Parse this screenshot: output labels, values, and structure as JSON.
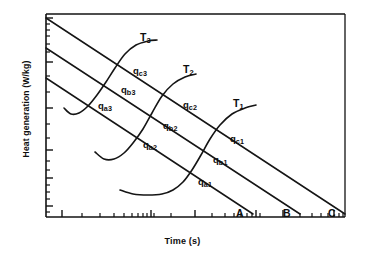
{
  "chart_data": {
    "type": "line",
    "title": "",
    "xlabel": "Time (s)",
    "ylabel": "Heat generation (W/kg)",
    "x_scale": "log",
    "y_scale": "log",
    "grid": false,
    "legend": "none",
    "axis_ticks_labeled": false,
    "series": [
      {
        "name": "A",
        "kind": "dissipation-line",
        "label": "A",
        "label_xy": [
          236,
          208
        ],
        "points": [
          [
            46,
            78
          ],
          [
            253,
            214
          ]
        ]
      },
      {
        "name": "B",
        "kind": "dissipation-line",
        "label": "B",
        "label_xy": [
          283,
          208
        ],
        "points": [
          [
            46,
            48
          ],
          [
            300,
            214
          ]
        ]
      },
      {
        "name": "C",
        "kind": "dissipation-line",
        "label": "C",
        "label_xy": [
          328,
          208
        ],
        "points": [
          [
            46,
            18
          ],
          [
            345,
            214
          ]
        ]
      },
      {
        "name": "T3",
        "kind": "generation-curve",
        "label": "T3",
        "label_xy": [
          140,
          32
        ],
        "points": [
          [
            64,
            108
          ],
          [
            71,
            114
          ],
          [
            79,
            113
          ],
          [
            88,
            106
          ],
          [
            97,
            95
          ],
          [
            106,
            82
          ],
          [
            115,
            68
          ],
          [
            125,
            54
          ],
          [
            136,
            45
          ],
          [
            148,
            41
          ],
          [
            157,
            40
          ]
        ]
      },
      {
        "name": "T2",
        "kind": "generation-curve",
        "label": "T2",
        "label_xy": [
          183,
          64
        ],
        "points": [
          [
            95,
            152
          ],
          [
            104,
            159
          ],
          [
            114,
            159
          ],
          [
            124,
            153
          ],
          [
            133,
            143
          ],
          [
            143,
            129
          ],
          [
            152,
            113
          ],
          [
            162,
            96
          ],
          [
            173,
            84
          ],
          [
            185,
            77
          ],
          [
            196,
            74
          ]
        ]
      },
      {
        "name": "T1",
        "kind": "generation-curve",
        "label": "T1",
        "label_xy": [
          233,
          98
        ],
        "points": [
          [
            120,
            190
          ],
          [
            133,
            194
          ],
          [
            148,
            195
          ],
          [
            162,
            194
          ],
          [
            173,
            190
          ],
          [
            183,
            182
          ],
          [
            192,
            170
          ],
          [
            201,
            155
          ],
          [
            210,
            139
          ],
          [
            220,
            125
          ],
          [
            232,
            114
          ],
          [
            245,
            108
          ],
          [
            256,
            105
          ]
        ]
      }
    ],
    "intersection_labels": [
      {
        "id": "qa3",
        "base": "q",
        "sub": "a3",
        "x": 98,
        "y": 101,
        "line": "A",
        "curve": "T3"
      },
      {
        "id": "qb3",
        "base": "q",
        "sub": "b3",
        "x": 121,
        "y": 85,
        "line": "B",
        "curve": "T3"
      },
      {
        "id": "qc3",
        "base": "q",
        "sub": "c3",
        "x": 133,
        "y": 66,
        "line": "C",
        "curve": "T3"
      },
      {
        "id": "qa2",
        "base": "q",
        "sub": "a2",
        "x": 143,
        "y": 140,
        "line": "A",
        "curve": "T2"
      },
      {
        "id": "qb2",
        "base": "q",
        "sub": "b2",
        "x": 163,
        "y": 121,
        "line": "B",
        "curve": "T2"
      },
      {
        "id": "qc2",
        "base": "q",
        "sub": "c2",
        "x": 183,
        "y": 100,
        "line": "C",
        "curve": "T2"
      },
      {
        "id": "qa1",
        "base": "q",
        "sub": "a1",
        "x": 198,
        "y": 177,
        "line": "A",
        "curve": "T1"
      },
      {
        "id": "qb1",
        "base": "q",
        "sub": "b1",
        "x": 213,
        "y": 155,
        "line": "B",
        "curve": "T1"
      },
      {
        "id": "qc1",
        "base": "q",
        "sub": "c1",
        "x": 230,
        "y": 134,
        "line": "C",
        "curve": "T1"
      }
    ],
    "axes": {
      "plot_left": 46,
      "plot_right": 345,
      "plot_top": 14,
      "plot_bottom": 217,
      "y_ticks": [
        18,
        24,
        30,
        36,
        44,
        52,
        62,
        76,
        92,
        108,
        124,
        138,
        150,
        161,
        170,
        178,
        185,
        192,
        199,
        206,
        212
      ],
      "y_major_ticks": [
        18,
        62,
        108,
        150,
        178,
        206
      ],
      "x_ticks": [
        62,
        82,
        100,
        114,
        124,
        132,
        138,
        143,
        147,
        151,
        154,
        171,
        195,
        212,
        225,
        234,
        241,
        247,
        252,
        256,
        260,
        283,
        300,
        312,
        321,
        328,
        334,
        339,
        343
      ],
      "x_major_ticks": [
        62,
        151,
        195,
        256,
        283,
        334
      ]
    },
    "colors": {
      "ink": "#121212",
      "background": "#ffffff"
    }
  },
  "labels": {
    "ylabel": "Heat generation (W/kg)",
    "xlabel": "Time (s)",
    "T1": "T",
    "T1_sub": "1",
    "T2": "T",
    "T2_sub": "2",
    "T3": "T",
    "T3_sub": "3",
    "A": "A",
    "B": "B",
    "C": "C",
    "q": "q",
    "qa1_sub": "a1",
    "qb1_sub": "b1",
    "qc1_sub": "c1",
    "qa2_sub": "a2",
    "qb2_sub": "b2",
    "qc2_sub": "c2",
    "qa3_sub": "a3",
    "qb3_sub": "b3",
    "qc3_sub": "c3"
  }
}
